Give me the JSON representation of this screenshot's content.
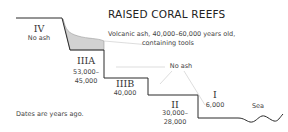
{
  "title": "RAISED CORAL REEFS",
  "volcanic_label": {
    "line1": "Volcanic ash, 40,000–60,000 years old,",
    "line2": "containing tools"
  },
  "no_ash_label": "No ash",
  "terraces": [
    {
      "name": "IV",
      "detail": "No ash"
    },
    {
      "name": "IIIA",
      "detail1": "53,000–",
      "detail2": "45,000"
    },
    {
      "name": "IIIB",
      "detail": "40,000"
    },
    {
      "name": "II",
      "detail1": "30,000–",
      "detail2": "28,000"
    },
    {
      "name": "I",
      "detail": "6,000"
    }
  ],
  "sea_label": "Sea",
  "footnote": "Dates are years ago.",
  "colors": {
    "profile_line": "#2a2a2a",
    "ash_fill": "#cfcfcf",
    "leader_line": "#c8c8c8"
  }
}
